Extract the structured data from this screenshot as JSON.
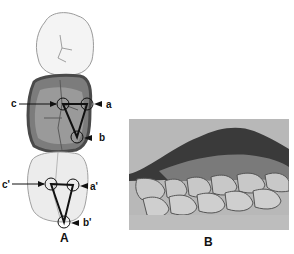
{
  "figure": {
    "panels": [
      {
        "id": "A",
        "caption": "A",
        "description": "Occlusal view of three posterior teeth; middle tooth shaded; triangles connecting cusp tips",
        "labels": {
          "a": "a",
          "b": "b",
          "c": "c",
          "a_prime": "a'",
          "b_prime": "b'",
          "c_prime": "c'"
        }
      },
      {
        "id": "B",
        "caption": "B",
        "description": "Grayscale photograph of dental cast in lateral view showing occlusion of upper and lower teeth"
      }
    ]
  }
}
